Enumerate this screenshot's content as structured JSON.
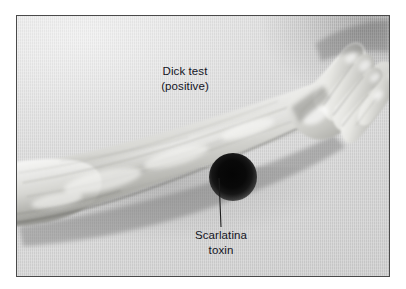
{
  "figure": {
    "kind": "medical-photograph-illustration",
    "frame_border_color": "#4a4a4a",
    "background_color": "#d9d9d9"
  },
  "annotations": {
    "test_label": {
      "name": "Dick test",
      "line1": "Dick test",
      "line2": "(positive)"
    },
    "toxin_label": {
      "name": "Scarlatina toxin",
      "line1": "Scarlatina",
      "line2": "toxin"
    }
  },
  "markers": {
    "lesion": {
      "name": "injection-site-reaction",
      "color": "#050505",
      "center_x": 216,
      "center_y": 161,
      "radius": 22
    },
    "leader_line": {
      "name": "pointer-line",
      "color": "#1c1c1c",
      "from_x": 219,
      "from_y": 178,
      "to_x": 221,
      "to_y": 227
    }
  },
  "colors": {
    "text": "#14141e",
    "skin_light": "#f2f2f0",
    "skin_mid": "#cfcfcb",
    "skin_shadow": "#8f8f8b",
    "backdrop": "#d9d9d9",
    "border": "#4a4a4a"
  }
}
